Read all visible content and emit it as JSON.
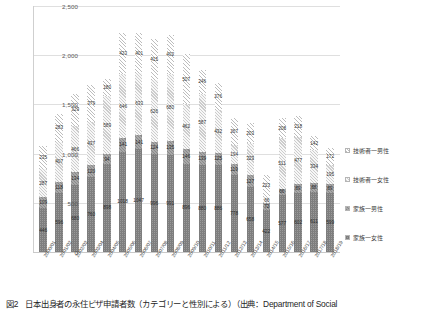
{
  "caption": {
    "figure_number": "図2",
    "text": "日本出身者の永住ビザ申請者数（カテゴリーと性別による）（出典：Department of Social"
  },
  "legend": {
    "position": "right",
    "items": [
      {
        "label": "技術者一男性",
        "marker": "hatch-light",
        "color": "#ffffff"
      },
      {
        "label": "技術者一女性",
        "marker": "hatch-pale",
        "color": "#f2f2f2"
      },
      {
        "label": "家族一男性",
        "marker": "hatch-mid",
        "color": "#9e9e9e"
      },
      {
        "label": "家族一女性",
        "marker": "grid-dark",
        "color": "#8f8f8f"
      }
    ]
  },
  "chart_data": {
    "type": "bar",
    "stacked": true,
    "title": "",
    "xlabel": "",
    "ylabel": "",
    "ylim": [
      0,
      2500
    ],
    "yticks": [
      "0",
      "500",
      "1,000",
      "1,500",
      "2,000",
      "2,500"
    ],
    "ytick_values": [
      0,
      500,
      1000,
      1500,
      2000,
      2500
    ],
    "grid": true,
    "legend_position": "right",
    "categories": [
      "2000/01",
      "2001/02",
      "2002/03",
      "2003/04",
      "2004/05",
      "2005/06",
      "2006/07",
      "2007/08",
      "2008/09",
      "2009/10",
      "2010/11",
      "2011/12",
      "2012/13",
      "2013/14",
      "2014/15",
      "2015/16",
      "2016/17",
      "2017/18",
      "2018/19"
    ],
    "series": [
      {
        "name": "家族一女性",
        "values": [
          446,
          596,
          680,
          760,
          898,
          1018,
          1047,
          996,
          991,
          896,
          880,
          886,
          778,
          658,
          422,
          577,
          602,
          611,
          599
        ]
      },
      {
        "name": "家族一男性",
        "values": [
          109,
          118,
          134,
          120,
          94,
          141,
          141,
          124,
          135,
          146,
          139,
          125,
          119,
          127,
          72,
          66,
          89,
          88,
          89
        ]
      },
      {
        "name": "技術者一女性",
        "values": [
          287,
          407,
          466,
          437,
          589,
          646,
          633,
          626,
          680,
          462,
          587,
          432,
          194,
          323,
          66,
          511,
          477,
          334,
          195
        ]
      },
      {
        "name": "技術者一男性",
        "values": [
          235,
          283,
          329,
          379,
          180,
          423,
          401,
          415,
          402,
          507,
          246,
          276,
          267,
          203,
          223,
          208,
          218,
          142,
          172
        ]
      }
    ],
    "totals": [
      1077,
      1404,
      1609,
      1696,
      1761,
      2228,
      2222,
      2161,
      2208,
      2011,
      1852,
      1719,
      1358,
      1311,
      783,
      1362,
      1386,
      1175,
      1055
    ]
  }
}
